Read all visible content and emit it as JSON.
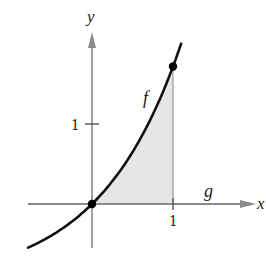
{
  "chart_data": {
    "type": "line",
    "title": "",
    "xlabel": "x",
    "ylabel": "y",
    "xlim": [
      -0.79,
      1.1
    ],
    "ylim": [
      -0.55,
      2.0
    ],
    "grid": false,
    "legend": "none",
    "x_ticks": [
      {
        "value": 1,
        "label": "1"
      }
    ],
    "y_ticks": [
      {
        "value": 1,
        "label": "1"
      }
    ],
    "series": [
      {
        "name": "f",
        "label": "f",
        "description": "exponential-like increasing curve through origin (approx. e^x - 1)",
        "x": [
          -0.79,
          -0.6,
          -0.4,
          -0.2,
          0,
          0.2,
          0.4,
          0.6,
          0.8,
          1.0,
          1.1
        ],
        "values": [
          -0.55,
          -0.45,
          -0.33,
          -0.18,
          0,
          0.22,
          0.49,
          0.82,
          1.23,
          1.72,
          2.0
        ],
        "color": "#111111"
      },
      {
        "name": "g",
        "label": "g",
        "description": "g(x) = 0, coincides with the x-axis",
        "x": [
          -0.79,
          1.1
        ],
        "values": [
          0,
          0
        ],
        "color": "#888888"
      }
    ],
    "points": [
      {
        "x": 0,
        "y": 0
      },
      {
        "x": 1,
        "y": 1.72
      }
    ],
    "shaded_region": {
      "between": [
        "f",
        "g"
      ],
      "x_from": 0,
      "x_to": 1,
      "color": "#e6e6e6"
    },
    "annotations": [
      {
        "text": "f",
        "near": "curve f"
      },
      {
        "text": "g",
        "near": "x-axis right of x=1"
      }
    ]
  },
  "labels": {
    "x_axis": "x",
    "y_axis": "y",
    "x_tick_1": "1",
    "y_tick_1": "1",
    "f_label": "f",
    "g_label": "g"
  },
  "colors": {
    "axis": "#8a8a8a",
    "curve": "#111111",
    "shade": "#e6e6e6",
    "point": "#000000"
  }
}
